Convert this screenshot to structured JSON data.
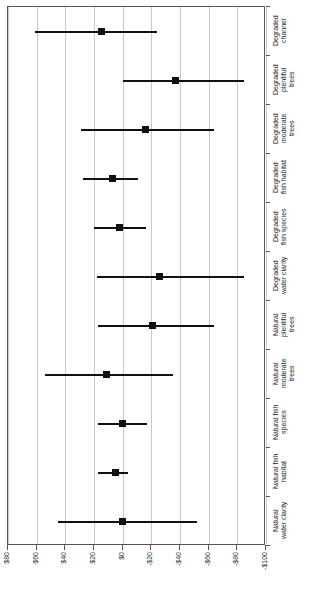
{
  "chart_data": {
    "type": "scatter",
    "title": "",
    "subtitle": "",
    "xlabel": "",
    "ylabel": "",
    "orientation": "horizontal-forest-plot",
    "grid": true,
    "legend": "none",
    "axis": {
      "value_axis_position": "bottom",
      "category_axis_position": "right",
      "xlim": [
        80,
        -100
      ],
      "direction": "decreasing-left-to-right",
      "tick_values": [
        80,
        60,
        40,
        20,
        0,
        -20,
        -40,
        -60,
        -80,
        -100
      ],
      "tick_labels": [
        "$80",
        "$60",
        "$40",
        "$20",
        "$0",
        "-$20",
        "-$40",
        "-$60",
        "-$80",
        "-$100"
      ]
    },
    "categories": [
      "Degraded\nchannel",
      "Degraded\nplentiful\ntrees",
      "Degraded\nmoderate\ntrees",
      "Degraded\nfish habitat",
      "Degraded\nfish species",
      "Degraded\nwater clarity",
      "Natural\nplentiful\ntrees",
      "Natural\nmoderate\ntrees",
      "Natural fish\nspecies",
      "Natural fish\nhabitat",
      "Natural\nwater clarity"
    ],
    "points": [
      {
        "category": "Degraded channel",
        "estimate": 15,
        "low": -24,
        "high": 61
      },
      {
        "category": "Degraded plentiful trees",
        "estimate": -37,
        "low": -85,
        "high": 0
      },
      {
        "category": "Degraded moderate trees",
        "estimate": -16,
        "low": -64,
        "high": 29
      },
      {
        "category": "Degraded fish habitat",
        "estimate": 7,
        "low": -11,
        "high": 28
      },
      {
        "category": "Degraded fish species",
        "estimate": 2,
        "low": -16,
        "high": 20
      },
      {
        "category": "Degraded water clarity",
        "estimate": -26,
        "low": -85,
        "high": 18
      },
      {
        "category": "Natural plentiful trees",
        "estimate": -21,
        "low": -64,
        "high": 17
      },
      {
        "category": "Natural moderate trees",
        "estimate": 11,
        "low": -35,
        "high": 54
      },
      {
        "category": "Natural fish species",
        "estimate": 0,
        "low": -17,
        "high": 17
      },
      {
        "category": "Natural fish habitat",
        "estimate": 5,
        "low": -4,
        "high": 17
      },
      {
        "category": "Natural water clarity",
        "estimate": 0,
        "low": -52,
        "high": 45
      }
    ],
    "series": [
      {
        "name": "Estimate with confidence interval",
        "values": [
          15,
          -37,
          -16,
          7,
          2,
          -26,
          -21,
          11,
          0,
          5,
          0
        ]
      }
    ]
  }
}
